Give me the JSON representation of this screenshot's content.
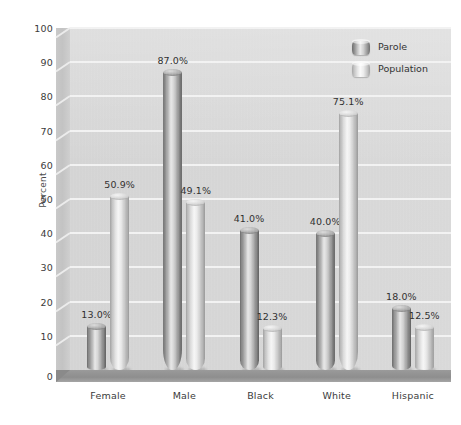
{
  "chart_data": {
    "type": "bar",
    "title": "",
    "xlabel": "",
    "ylabel": "Percent",
    "ylim": [
      0,
      100
    ],
    "ytick_step": 10,
    "yticks": [
      0,
      10,
      20,
      30,
      40,
      50,
      60,
      70,
      80,
      90,
      100
    ],
    "ytick_labels": [
      "0",
      "10",
      "20",
      "30",
      "40",
      "50",
      "60",
      "70",
      "80",
      "90",
      "100"
    ],
    "grid": true,
    "legend_position": "top-right",
    "categories": [
      "Female",
      "Male",
      "Black",
      "White",
      "Hispanic"
    ],
    "series": [
      {
        "name": "Parole",
        "color": "#8a8a8a",
        "values": [
          13.0,
          87.0,
          41.0,
          40.0,
          18.0
        ],
        "labels": [
          "13.0%",
          "87.0%",
          "41.0%",
          "40.0%",
          "18.0%"
        ]
      },
      {
        "name": "Population",
        "color": "#d0d0d0",
        "values": [
          50.9,
          49.1,
          12.3,
          75.1,
          12.5
        ],
        "labels": [
          "50.9%",
          "49.1%",
          "12.3%",
          "75.1%",
          "12.5%"
        ]
      }
    ]
  },
  "legend": {
    "items": [
      {
        "label": "Parole",
        "swatch": "cylinder-dark-icon"
      },
      {
        "label": "Population",
        "swatch": "cylinder-light-icon"
      }
    ]
  },
  "axes": {
    "y_title": "Percent"
  }
}
